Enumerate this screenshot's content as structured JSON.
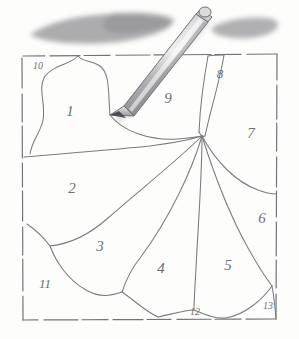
{
  "figure": {
    "medium": "graphite pencil on paper",
    "paper_color": "#fdfdfc",
    "line_color": "#6e6e72",
    "frame": {
      "name": "sketch-border",
      "style": "dashed hand-drawn rectangle",
      "x": 22,
      "y": 55,
      "width": 255,
      "height": 265
    },
    "regions": [
      {
        "id": "1",
        "label": "1",
        "x": 70,
        "y": 111,
        "size": "lbl-lg"
      },
      {
        "id": "2",
        "label": "2",
        "x": 72,
        "y": 188,
        "size": "lbl-lg"
      },
      {
        "id": "3",
        "label": "3",
        "x": 100,
        "y": 246,
        "size": "lbl-lg"
      },
      {
        "id": "4",
        "label": "4",
        "x": 161,
        "y": 268,
        "size": "lbl-lg"
      },
      {
        "id": "5",
        "label": "5",
        "x": 228,
        "y": 265,
        "size": "lbl-lg"
      },
      {
        "id": "6",
        "label": "6",
        "x": 262,
        "y": 218,
        "size": "lbl-lg"
      },
      {
        "id": "7",
        "label": "7",
        "x": 251,
        "y": 133,
        "size": "lbl-lg"
      },
      {
        "id": "8",
        "label": "8",
        "x": 220,
        "y": 73,
        "size": "lbl-md"
      },
      {
        "id": "9",
        "label": "9",
        "x": 168,
        "y": 98,
        "size": "lbl-lg"
      },
      {
        "id": "10",
        "label": "10",
        "x": 38,
        "y": 66,
        "size": "lbl-sm"
      },
      {
        "id": "11",
        "label": "11",
        "x": 45,
        "y": 283,
        "size": "lbl-md"
      },
      {
        "id": "12",
        "label": "12",
        "x": 195,
        "y": 312,
        "size": "lbl-sm"
      },
      {
        "id": "13",
        "label": "13",
        "x": 268,
        "y": 306,
        "size": "lbl-sm"
      }
    ],
    "smudges": [
      {
        "name": "left-graphite-smudge",
        "cx": 100,
        "cy": 28,
        "rx": 72,
        "ry": 12
      },
      {
        "name": "right-graphite-smudge",
        "cx": 245,
        "cy": 28,
        "rx": 33,
        "ry": 9
      }
    ],
    "pencil": {
      "name": "pencil",
      "tip_x": 110,
      "tip_y": 115,
      "end_x": 205,
      "end_y": 12,
      "body_color": "#b9b9bb",
      "tip_color": "#55555a"
    }
  }
}
